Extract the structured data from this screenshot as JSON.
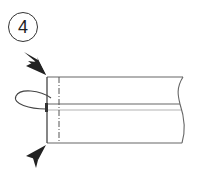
{
  "step": {
    "number": "4"
  },
  "diagram": {
    "colors": {
      "line": "#666666",
      "arrow": "#222222",
      "fold_guide": "#555555"
    }
  }
}
